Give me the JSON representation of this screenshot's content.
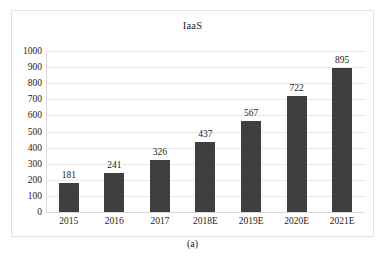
{
  "figure": {
    "caption": "(a)",
    "frame_border_color": "#e3e3e3"
  },
  "chart_data": {
    "type": "bar",
    "title": "IaaS",
    "xlabel": "",
    "ylabel": "",
    "categories": [
      "2015",
      "2016",
      "2017",
      "2018E",
      "2019E",
      "2020E",
      "2021E"
    ],
    "values": [
      181,
      241,
      326,
      437,
      567,
      722,
      895
    ],
    "data_labels": [
      "181",
      "241",
      "326",
      "437",
      "567",
      "722",
      "895"
    ],
    "ylim": [
      0,
      1000
    ],
    "yticks": [
      1000,
      900,
      800,
      700,
      600,
      500,
      400,
      300,
      200,
      100,
      0
    ],
    "ytick_labels": [
      "1000",
      "900",
      "800",
      "700",
      "600",
      "500",
      "400",
      "300",
      "200",
      "100",
      "0"
    ],
    "grid": true,
    "grid_axis": "y",
    "legend": false,
    "legend_position": "none",
    "bar_color": "#3f3f3f",
    "gridline_color": "#e8e8e8",
    "background_color": "#ffffff"
  }
}
